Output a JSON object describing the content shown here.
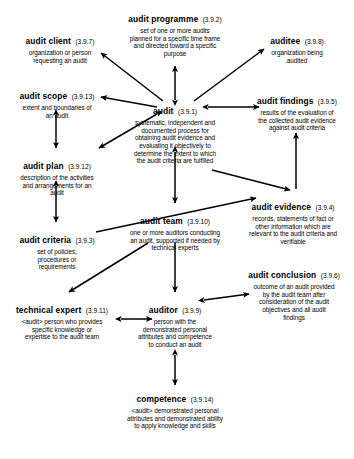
{
  "diagram": {
    "canvas": {
      "width": 354,
      "height": 459
    },
    "style": {
      "background": "#ffffff",
      "text_color": "#000000",
      "arrow_color": "#000000"
    },
    "nodes": [
      {
        "id": "audit-programme",
        "term": "audit programme",
        "ref": "(3.9.2)",
        "definition_lines": [
          "set of one or more audits",
          "planned for a specific time frame",
          "and directed toward a specific",
          "purpose"
        ]
      },
      {
        "id": "audit-client",
        "term": "audit client",
        "ref": "(3.9.7)",
        "definition_lines": [
          "organization or person",
          "requesting an audit"
        ]
      },
      {
        "id": "auditee",
        "term": "auditee",
        "ref": "(3.9.8)",
        "definition_lines": [
          "organization being",
          "audited"
        ]
      },
      {
        "id": "audit-scope",
        "term": "audit scope",
        "ref": "(3.9.13)",
        "definition_lines": [
          "extent and boundaries of",
          "an audit"
        ]
      },
      {
        "id": "audit",
        "term": "audit",
        "ref": "(3.9.1)",
        "definition_lines": [
          "systematic, independent and",
          "documented process for",
          "obtaining audit evidence and",
          "evaluating it objectively to",
          "determine the extent to which",
          "the audit criteria are fulfilled"
        ]
      },
      {
        "id": "audit-findings",
        "term": "audit findings",
        "ref": "(3.9.5)",
        "definition_lines": [
          "results of the evaluation of",
          "the collected audit evidence",
          "against audit criteria"
        ]
      },
      {
        "id": "audit-plan",
        "term": "audit plan",
        "ref": "(3.9.12)",
        "definition_lines": [
          "description of the activities",
          "and arrangements for an",
          "audit"
        ]
      },
      {
        "id": "audit-criteria",
        "term": "audit criteria",
        "ref": "(3.9.3)",
        "definition_lines": [
          "set of policies,",
          "procedures or",
          "requirements"
        ]
      },
      {
        "id": "audit-team",
        "term": "audit team",
        "ref": "(3.9.10)",
        "definition_lines": [
          "one or more auditors conducting",
          "an audit, supported if needed by",
          "technical experts"
        ]
      },
      {
        "id": "audit-evidence",
        "term": "audit evidence",
        "ref": "(3.9.4)",
        "definition_lines": [
          "records, statements of fact or",
          "other information which are",
          "relevant to the audit criteria and",
          "verifiable"
        ]
      },
      {
        "id": "technical-expert",
        "term": "technical expert",
        "ref": "(3.9.11)",
        "definition_lines": [
          "<audit> person who provides",
          "specific knowledge or",
          "expertise to the audit team"
        ]
      },
      {
        "id": "auditor",
        "term": "auditor",
        "ref": "(3.9.9)",
        "definition_lines": [
          "person with the",
          "demonstrated personal",
          "attributes and competence",
          "to conduct an audit"
        ]
      },
      {
        "id": "audit-conclusion",
        "term": "audit conclusion",
        "ref": "(3.9.6)",
        "definition_lines": [
          "outcome of an audit provided",
          "by the audit team after",
          "consideration of the audit",
          "objectives and all audit",
          "findings"
        ]
      },
      {
        "id": "competence",
        "term": "competence",
        "ref": "(3.9.14)",
        "definition_lines": [
          "<audit> demonstrated personal",
          "attributes and demonstrated ability",
          "to apply knowledge and skills"
        ]
      }
    ],
    "connections": [
      {
        "from": "audit",
        "to": "audit-client",
        "heads": "to"
      },
      {
        "from": "audit",
        "to": "auditee",
        "heads": "to"
      },
      {
        "from": "audit",
        "to": "audit-programme",
        "heads": "both"
      },
      {
        "from": "audit",
        "to": "audit-scope",
        "heads": "to"
      },
      {
        "from": "audit",
        "to": "audit-findings",
        "heads": "both"
      },
      {
        "from": "audit",
        "to": "audit-plan",
        "heads": "both"
      },
      {
        "from": "audit-scope",
        "to": "audit-plan",
        "heads": "both"
      },
      {
        "from": "audit-plan",
        "to": "audit-criteria",
        "heads": "both"
      },
      {
        "from": "audit",
        "to": "audit-team",
        "heads": "both"
      },
      {
        "from": "audit-evidence",
        "to": "audit-findings",
        "heads": "to"
      },
      {
        "from": "audit-team",
        "to": "audit-evidence",
        "heads": "to"
      },
      {
        "from": "audit-criteria",
        "to": "audit-evidence",
        "heads": "to"
      },
      {
        "from": "audit-team",
        "to": "auditor",
        "heads": "to"
      },
      {
        "from": "audit-team",
        "to": "technical-expert",
        "heads": "to"
      },
      {
        "from": "technical-expert",
        "to": "auditor",
        "heads": "both"
      },
      {
        "from": "auditor",
        "to": "audit-conclusion",
        "heads": "both"
      },
      {
        "from": "auditor",
        "to": "competence",
        "heads": "both"
      }
    ]
  }
}
